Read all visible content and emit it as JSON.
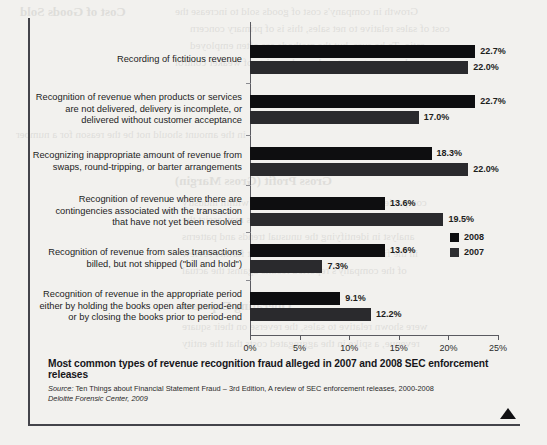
{
  "chart_data": {
    "type": "bar",
    "orientation": "horizontal",
    "title": "Most common types of revenue recognition fraud alleged in 2007 and 2008 SEC enforcement releases",
    "xlabel": "",
    "ylabel": "",
    "xlim": [
      0,
      25
    ],
    "grid": false,
    "legend_position": "right",
    "tick_labels": [
      "0%",
      "5%",
      "10%",
      "15%",
      "20%",
      "25%"
    ],
    "tick_values": [
      0,
      5,
      10,
      15,
      20,
      25
    ],
    "categories": [
      "Recording of fictitious revenue",
      "Recognition of revenue when products or services are not delivered, delivery is incomplete, or delivered without customer acceptance",
      "Recognizing inappropriate amount of revenue from swaps, round-tripping, or barter arrangements",
      "Recognition of revenue where there are contingencies associated with the transaction that have not yet been resolved",
      "Recognition of revenue from sales transactions billed, but not shipped (\"bill and hold\")",
      "Recognition of revenue in the appropriate period either by holding the books open after period-end or by closing the books prior to period-end"
    ],
    "category_lines": [
      [
        "Recording of fictitious revenue"
      ],
      [
        "Recognition of revenue when products or services",
        "are not delivered, delivery is incomplete, or",
        "delivered without customer acceptance"
      ],
      [
        "Recognizing inappropriate amount of revenue from",
        "swaps, round-tripping, or barter arrangements"
      ],
      [
        "Recognition of revenue where there are",
        "contingencies associated with the transaction",
        "that have not yet been resolved"
      ],
      [
        "Recognition of revenue from sales transactions",
        "billed, but not shipped (\"bill and hold\")"
      ],
      [
        "Recognition of revenue in the appropriate period",
        "either by holding the books open after period-end",
        "or by closing the books prior to period-end"
      ]
    ],
    "series": [
      {
        "name": "2008",
        "color": "#0e0e10",
        "values": [
          22.7,
          22.7,
          18.3,
          13.6,
          13.6,
          9.1
        ],
        "labels": [
          "22.7%",
          "22.7%",
          "18.3%",
          "13.6%",
          "13.6%",
          "9.1%"
        ]
      },
      {
        "name": "2007",
        "color": "#2a2a2d",
        "values": [
          22.0,
          17.0,
          22.0,
          19.5,
          7.3,
          12.2
        ],
        "labels": [
          "22.0%",
          "17.0%",
          "22.0%",
          "19.5%",
          "7.3%",
          "12.2%"
        ]
      }
    ]
  },
  "legend": {
    "items": [
      {
        "label": "2008",
        "color": "#0e0e10"
      },
      {
        "label": "2007",
        "color": "#2e2e31"
      }
    ]
  },
  "source": {
    "prefix": "Source:",
    "line1": " Ten Things about Financial Statement Fraud – 3rd Edition, A review of SEC enforcement releases, 2000-2008",
    "line2": "Deloitte Forensic Center, 2009"
  },
  "bleed_text": [
    {
      "t": "Cost of Goods Sold",
      "x": 20,
      "y": 4,
      "s": 13,
      "b": true
    },
    {
      "t": "Growth in company's cost of goods sold to increase the",
      "x": 175,
      "y": 5,
      "s": 11,
      "b": false
    },
    {
      "t": "cost of sales relative to net sales, this is of primary concern",
      "x": 190,
      "y": 22,
      "s": 11,
      "b": false
    },
    {
      "t": "ratio. To be sure, but the methods are often employed",
      "x": 190,
      "y": 39,
      "s": 11,
      "b": false
    },
    {
      "t": "by management and may be a sign of weaker control",
      "x": 175,
      "y": 56,
      "s": 11,
      "b": false
    },
    {
      "t": "in the amount should not be the reason for a number",
      "x": 16,
      "y": 128,
      "s": 11,
      "b": false
    },
    {
      "t": "Gross Profit (Gross Margin)",
      "x": 175,
      "y": 173,
      "s": 13,
      "b": true
    },
    {
      "t": "companies show unusual profit margins within industry",
      "x": 182,
      "y": 196,
      "s": 11,
      "b": false
    },
    {
      "t": "analysis and benchmarking against peers may assist the",
      "x": 182,
      "y": 213,
      "s": 11,
      "b": false
    },
    {
      "t": "analyst in identifying the unusual trends and patterns",
      "x": 182,
      "y": 230,
      "s": 11,
      "b": false
    },
    {
      "t": "in the financial statements that warrant further review",
      "x": 182,
      "y": 247,
      "s": 11,
      "b": false
    },
    {
      "t": "of the company's reported results against the actual",
      "x": 182,
      "y": 264,
      "s": 11,
      "b": false
    },
    {
      "t": "Operating Expenses",
      "x": 180,
      "y": 298,
      "s": 13,
      "b": true
    },
    {
      "t": "were shown relative to sales, the reverse on their square",
      "x": 182,
      "y": 320,
      "s": 11,
      "b": false
    },
    {
      "t": "revenue, a spike in the aggregated costs that the entity",
      "x": 182,
      "y": 337,
      "s": 11,
      "b": false
    }
  ]
}
